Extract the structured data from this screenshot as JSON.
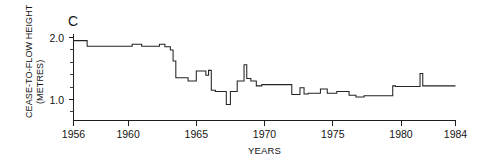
{
  "figure": {
    "panel_label": "C",
    "background_color": "#ffffff",
    "line_color": "#232323"
  },
  "chart_data": {
    "type": "line",
    "title": "",
    "subtitle": "",
    "panel": "C",
    "xlabel": "YEARS",
    "ylabel": "CEASE-TO-FLOW HEIGHT (METRES)",
    "ylabel_line1": "CEASE-TO-FLOW HEIGHT",
    "ylabel_line2": "(METRES)",
    "xlim": [
      1956,
      1984
    ],
    "ylim": [
      0.6,
      2.05
    ],
    "grid": false,
    "legend": null,
    "x_major_ticks": [
      1956,
      1960,
      1965,
      1970,
      1975,
      1980,
      1984
    ],
    "x_tick_labels": [
      "1956",
      "1960",
      "1965",
      "1970",
      "1975",
      "1980",
      "1984"
    ],
    "y_major_ticks": [
      1.0,
      2.0
    ],
    "y_tick_labels": [
      "1.0",
      "2.0"
    ],
    "y_minor_ticks": [
      1.2,
      1.4,
      1.6,
      1.8
    ],
    "step_style": "post",
    "series": [
      {
        "name": "Cease-to-flow height",
        "x": [
          1956.0,
          1957.0,
          1957.0,
          1960.3,
          1960.3,
          1961.0,
          1961.0,
          1962.3,
          1962.3,
          1962.7,
          1962.7,
          1963.1,
          1963.1,
          1963.3,
          1963.3,
          1963.5,
          1963.5,
          1964.4,
          1964.4,
          1965.0,
          1965.0,
          1965.7,
          1965.7,
          1965.9,
          1965.9,
          1966.1,
          1966.1,
          1966.4,
          1966.4,
          1967.2,
          1967.2,
          1967.5,
          1967.5,
          1968.0,
          1968.0,
          1968.5,
          1968.5,
          1968.7,
          1968.7,
          1969.0,
          1969.0,
          1969.4,
          1969.4,
          1969.8,
          1969.8,
          1972.0,
          1972.0,
          1972.6,
          1972.6,
          1972.9,
          1972.9,
          1973.2,
          1973.2,
          1974.1,
          1974.1,
          1974.6,
          1974.6,
          1975.3,
          1975.3,
          1976.2,
          1976.2,
          1976.7,
          1976.7,
          1977.3,
          1977.3,
          1979.4,
          1979.4,
          1979.6,
          1979.6,
          1981.4,
          1981.4,
          1981.6,
          1981.6,
          1984.0
        ],
        "y": [
          1.95,
          1.95,
          1.86,
          1.86,
          1.89,
          1.89,
          1.86,
          1.86,
          1.89,
          1.89,
          1.85,
          1.85,
          1.8,
          1.8,
          1.62,
          1.62,
          1.35,
          1.35,
          1.3,
          1.3,
          1.46,
          1.46,
          1.39,
          1.39,
          1.47,
          1.47,
          1.15,
          1.15,
          1.13,
          1.13,
          0.92,
          0.92,
          1.13,
          1.13,
          1.3,
          1.3,
          1.56,
          1.56,
          1.34,
          1.34,
          1.3,
          1.3,
          1.22,
          1.22,
          1.24,
          1.24,
          1.08,
          1.08,
          1.19,
          1.19,
          1.09,
          1.09,
          1.1,
          1.1,
          1.17,
          1.17,
          1.1,
          1.1,
          1.13,
          1.13,
          1.07,
          1.07,
          1.04,
          1.04,
          1.06,
          1.06,
          1.22,
          1.22,
          1.21,
          1.21,
          1.42,
          1.42,
          1.22,
          1.22
        ]
      }
    ]
  }
}
